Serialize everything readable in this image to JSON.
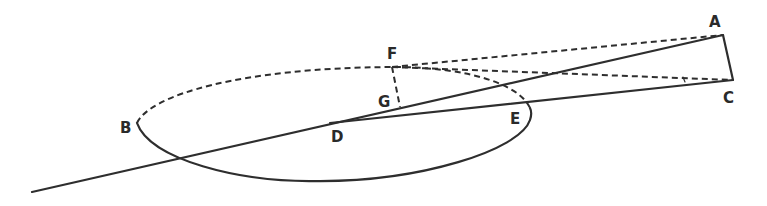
{
  "diagram": {
    "type": "geometric-figure",
    "points": [
      {
        "id": "A",
        "label": "A"
      },
      {
        "id": "B",
        "label": "B"
      },
      {
        "id": "C",
        "label": "C"
      },
      {
        "id": "D",
        "label": "D"
      },
      {
        "id": "E",
        "label": "E"
      },
      {
        "id": "F",
        "label": "F"
      },
      {
        "id": "G",
        "label": "G"
      }
    ],
    "colors": {
      "stroke": "#2e2e2e",
      "background": "#ffffff"
    }
  }
}
